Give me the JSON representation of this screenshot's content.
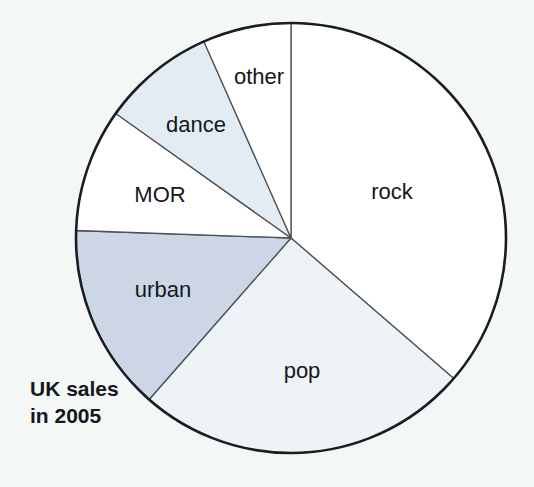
{
  "figure": {
    "caption_line1": "UK sales",
    "caption_line2": "in 2005",
    "background_color": "#f3f7f6",
    "outline_color": "#1b1d22"
  },
  "chart_data": {
    "type": "pie",
    "title": "UK sales in 2005",
    "subtitle": "",
    "xlabel": "",
    "ylabel": "",
    "legend_position": "none",
    "grid": false,
    "labels_on_slices": true,
    "start_angle_deg": 0,
    "direction": "clockwise",
    "categories": [
      "rock",
      "pop",
      "urban",
      "MOR",
      "dance",
      "other"
    ],
    "values": [
      36.3,
      25.1,
      14.1,
      9.3,
      8.5,
      6.6
    ],
    "units": "percent of UK sales",
    "slices": [
      {
        "label": "rock",
        "value": 36.3,
        "start_angle": 0,
        "end_angle": 130.8,
        "color": "#ffffff",
        "label_x": 392,
        "label_y": 193
      },
      {
        "label": "pop",
        "value": 25.1,
        "start_angle": 130.8,
        "end_angle": 221.3,
        "color": "#eef3f7",
        "label_x": 302,
        "label_y": 372
      },
      {
        "label": "urban",
        "value": 14.1,
        "start_angle": 221.3,
        "end_angle": 272.0,
        "color": "#ccd6e4",
        "label_x": 163,
        "label_y": 291
      },
      {
        "label": "MOR",
        "value": 9.3,
        "start_angle": 272.0,
        "end_angle": 305.4,
        "color": "#ffffff",
        "label_x": 160,
        "label_y": 196
      },
      {
        "label": "dance",
        "value": 8.5,
        "start_angle": 305.4,
        "end_angle": 336.1,
        "color": "#e3ecf3",
        "label_x": 196,
        "label_y": 126
      },
      {
        "label": "other",
        "value": 6.6,
        "start_angle": 336.1,
        "end_angle": 360.0,
        "color": "#ffffff",
        "label_x": 259,
        "label_y": 78
      }
    ],
    "geometry": {
      "center_x": 291,
      "center_y": 238,
      "radius": 215
    }
  }
}
